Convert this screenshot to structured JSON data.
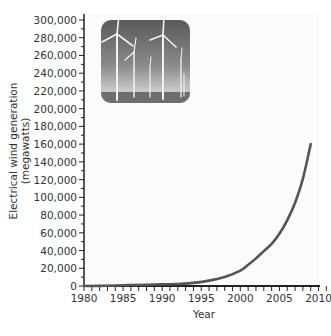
{
  "chart_data": {
    "type": "line",
    "title": "",
    "xlabel": "Year",
    "ylabel": "Electrical wind generation (megawatts)",
    "ylabel_lines": [
      "Electrical wind generation",
      "(megawatts)"
    ],
    "xlim": [
      1980,
      2011
    ],
    "ylim": [
      0,
      300000
    ],
    "x_ticks": [
      1980,
      1985,
      1990,
      1995,
      2000,
      2005,
      2010
    ],
    "x_tick_labels": [
      "1980",
      "1985",
      "1990",
      "1995",
      "2000",
      "2005",
      "2010"
    ],
    "y_ticks": [
      0,
      20000,
      40000,
      60000,
      80000,
      100000,
      120000,
      140000,
      160000,
      180000,
      200000,
      220000,
      240000,
      260000,
      280000,
      300000
    ],
    "y_tick_labels": [
      "0",
      "20,000",
      "40,000",
      "60,000",
      "80,000",
      "100,000",
      "120,000",
      "140,000",
      "160,000",
      "180,000",
      "200,000",
      "220,000",
      "240,000",
      "260,000",
      "280,000",
      "300,000"
    ],
    "grid": false,
    "legend": null,
    "series": [
      {
        "name": "Electrical wind generation",
        "color": "#555555",
        "x": [
          1980,
          1982,
          1984,
          1986,
          1988,
          1990,
          1992,
          1994,
          1996,
          1998,
          2000,
          2001,
          2002,
          2003,
          2004,
          2005,
          2006,
          2007,
          2008,
          2009
        ],
        "values": [
          10,
          90,
          600,
          1100,
          1500,
          1900,
          2300,
          3500,
          6100,
          10200,
          17400,
          23900,
          31100,
          39400,
          47600,
          59000,
          74000,
          94000,
          121000,
          160000
        ]
      }
    ],
    "inset_image": "wind-turbines-photo"
  }
}
